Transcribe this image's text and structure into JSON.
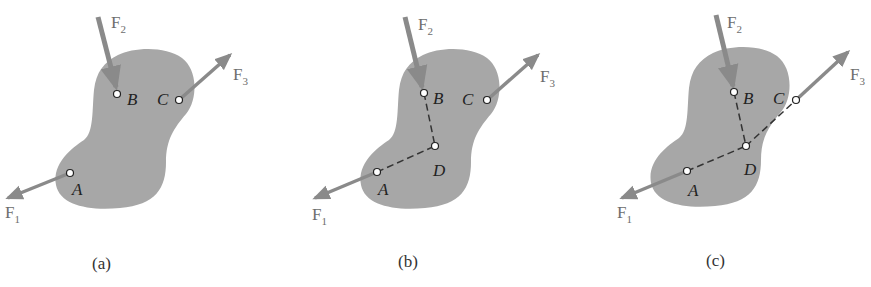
{
  "figure": {
    "panels": [
      {
        "id": "a",
        "caption": "(a)",
        "points": {
          "A": "A",
          "B": "B",
          "C": "C"
        },
        "forces": {
          "F1": {
            "base": "F",
            "sub": "1"
          },
          "F2": {
            "base": "F",
            "sub": "2"
          },
          "F3": {
            "base": "F",
            "sub": "3"
          }
        }
      },
      {
        "id": "b",
        "caption": "(b)",
        "points": {
          "A": "A",
          "B": "B",
          "C": "C",
          "D": "D"
        },
        "forces": {
          "F1": {
            "base": "F",
            "sub": "1"
          },
          "F2": {
            "base": "F",
            "sub": "2"
          },
          "F3": {
            "base": "F",
            "sub": "3"
          }
        }
      },
      {
        "id": "c",
        "caption": "(c)",
        "points": {
          "A": "A",
          "B": "B",
          "C": "C",
          "D": "D"
        },
        "forces": {
          "F1": {
            "base": "F",
            "sub": "1"
          },
          "F2": {
            "base": "F",
            "sub": "2"
          },
          "F3": {
            "base": "F",
            "sub": "3"
          }
        }
      }
    ],
    "colors": {
      "body": "#a7a7a7",
      "arrow": "#8a8a8a",
      "dash": "#333333",
      "background": "#ffffff"
    }
  }
}
